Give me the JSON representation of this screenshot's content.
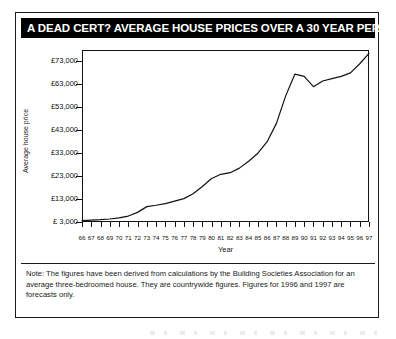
{
  "title": "A DEAD CERT? AVERAGE HOUSE PRICES OVER A 30 YEAR PERIOD",
  "note": "Note: The figures have been derived from calculations by the Building Societies Association for an average three-bedroomed house. They are countrywide figures. Figures for 1996 and 1997 are forecasts only.",
  "colors": {
    "title_bar_background": "#000000",
    "title_text": "#ffffff",
    "line": "#111111",
    "frame": "#111111",
    "page_background": "#ffffff"
  },
  "chart_data": {
    "type": "line",
    "title": "A DEAD CERT? AVERAGE HOUSE PRICES OVER A 30 YEAR PERIOD",
    "xlabel": "Year",
    "ylabel": "Average house price",
    "grid": false,
    "legend": "none",
    "xlim": [
      66,
      97
    ],
    "ylim": [
      3000,
      78000
    ],
    "y_tick_labels": [
      "£ 3,000",
      "£13,000",
      "£23,000",
      "£33,000",
      "£43,000",
      "£53,000",
      "£63,000",
      "£73,000"
    ],
    "y_tick_values": [
      3000,
      13000,
      23000,
      33000,
      43000,
      53000,
      63000,
      73000
    ],
    "x_tick_labels": [
      "66",
      "67",
      "68",
      "69",
      "70",
      "71",
      "72",
      "73",
      "74",
      "75",
      "76",
      "77",
      "78",
      "79",
      "80",
      "81",
      "82",
      "83",
      "84",
      "85",
      "86",
      "87",
      "88",
      "89",
      "90",
      "91",
      "92",
      "93",
      "94",
      "95",
      "96",
      "97"
    ],
    "x": [
      66,
      67,
      68,
      69,
      70,
      71,
      72,
      73,
      74,
      75,
      76,
      77,
      78,
      79,
      80,
      81,
      82,
      83,
      84,
      85,
      86,
      87,
      88,
      89,
      90,
      91,
      92,
      93,
      94,
      95,
      96,
      97
    ],
    "series": [
      {
        "name": "Average house price",
        "values": [
          3600,
          3800,
          4000,
          4300,
          4800,
          5600,
          7200,
          9700,
          10300,
          11000,
          12100,
          13200,
          15300,
          18500,
          22000,
          23800,
          24500,
          26500,
          29500,
          33000,
          38000,
          46000,
          58000,
          67500,
          66500,
          62000,
          64500,
          65500,
          66500,
          68000,
          72000,
          76500
        ]
      }
    ]
  }
}
